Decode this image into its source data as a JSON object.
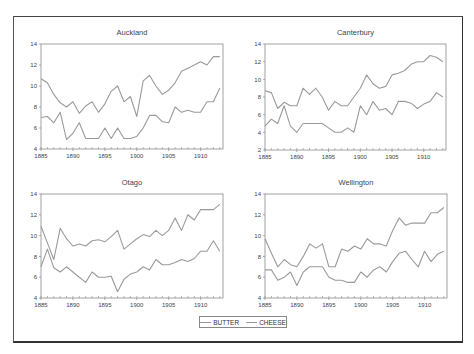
{
  "figure": {
    "legend": [
      {
        "name": "BUTTER",
        "color": "#9a9a9a"
      },
      {
        "name": "CHEESE",
        "color": "#9a9a9a"
      }
    ]
  },
  "chart_data": [
    {
      "type": "line",
      "title": "Auckland",
      "xlabel": "",
      "ylabel": "",
      "x": [
        1885,
        1886,
        1887,
        1888,
        1889,
        1890,
        1891,
        1892,
        1893,
        1894,
        1895,
        1896,
        1897,
        1898,
        1899,
        1900,
        1901,
        1902,
        1903,
        1904,
        1905,
        1906,
        1907,
        1908,
        1909,
        1910,
        1911,
        1912,
        1913
      ],
      "xticks": [
        1885,
        1890,
        1895,
        1900,
        1905,
        1910
      ],
      "yticks": [
        4,
        6,
        8,
        10,
        12,
        14
      ],
      "ylim": [
        4,
        14
      ],
      "grid": false,
      "series": [
        {
          "name": "BUTTER",
          "values": [
            10.7,
            10.3,
            9.2,
            8.4,
            8.0,
            8.5,
            7.4,
            8.1,
            8.5,
            7.5,
            8.3,
            9.5,
            10.0,
            8.5,
            9.0,
            7.1,
            10.5,
            11.0,
            10.0,
            9.2,
            9.6,
            10.3,
            11.4,
            11.7,
            12.0,
            12.3,
            12.0,
            12.8,
            12.8
          ]
        },
        {
          "name": "CHEESE",
          "values": [
            7.0,
            7.1,
            6.5,
            7.5,
            4.9,
            5.5,
            6.5,
            5.0,
            5.0,
            5.0,
            6.0,
            5.0,
            6.0,
            5.0,
            5.0,
            5.2,
            6.0,
            7.2,
            7.2,
            6.6,
            6.5,
            8.0,
            7.5,
            7.7,
            7.5,
            7.5,
            8.5,
            8.5,
            9.8
          ]
        }
      ]
    },
    {
      "type": "line",
      "title": "Canterbury",
      "xlabel": "",
      "ylabel": "",
      "x": [
        1885,
        1886,
        1887,
        1888,
        1889,
        1890,
        1891,
        1892,
        1893,
        1894,
        1895,
        1896,
        1897,
        1898,
        1899,
        1900,
        1901,
        1902,
        1903,
        1904,
        1905,
        1906,
        1907,
        1908,
        1909,
        1910,
        1911,
        1912,
        1913
      ],
      "xticks": [
        1885,
        1890,
        1895,
        1900,
        1905,
        1910
      ],
      "yticks": [
        2,
        4,
        6,
        8,
        10,
        12,
        14
      ],
      "ylim": [
        2,
        14
      ],
      "grid": false,
      "series": [
        {
          "name": "BUTTER",
          "values": [
            8.7,
            8.5,
            6.7,
            7.4,
            7.0,
            7.0,
            9.0,
            8.3,
            9.0,
            8.0,
            6.5,
            7.5,
            7.0,
            7.0,
            8.0,
            9.0,
            10.5,
            9.5,
            9.0,
            9.2,
            10.5,
            10.7,
            11.0,
            11.7,
            12.0,
            12.0,
            12.7,
            12.5,
            12.0
          ]
        },
        {
          "name": "CHEESE",
          "values": [
            4.7,
            5.5,
            5.0,
            7.0,
            4.7,
            4.0,
            5.0,
            5.0,
            5.0,
            5.0,
            4.5,
            4.0,
            4.0,
            4.5,
            4.0,
            7.0,
            6.0,
            7.5,
            6.5,
            6.7,
            6.0,
            7.5,
            7.5,
            7.3,
            6.7,
            7.2,
            7.5,
            8.5,
            8.0
          ]
        }
      ]
    },
    {
      "type": "line",
      "title": "Otago",
      "xlabel": "",
      "ylabel": "",
      "x": [
        1885,
        1886,
        1887,
        1888,
        1889,
        1890,
        1891,
        1892,
        1893,
        1894,
        1895,
        1896,
        1897,
        1898,
        1899,
        1900,
        1901,
        1902,
        1903,
        1904,
        1905,
        1906,
        1907,
        1908,
        1909,
        1910,
        1911,
        1912,
        1913
      ],
      "xticks": [
        1885,
        1890,
        1895,
        1900,
        1905,
        1910
      ],
      "yticks": [
        4,
        6,
        8,
        10,
        12,
        14
      ],
      "ylim": [
        4,
        14
      ],
      "grid": false,
      "series": [
        {
          "name": "BUTTER",
          "values": [
            10.9,
            9.3,
            7.7,
            10.7,
            9.7,
            9.0,
            9.2,
            9.0,
            9.5,
            9.6,
            9.4,
            9.9,
            10.5,
            8.7,
            9.2,
            9.7,
            10.1,
            9.9,
            10.5,
            10.0,
            10.5,
            11.7,
            10.5,
            12.0,
            11.5,
            12.5,
            12.5,
            12.5,
            13.0
          ]
        },
        {
          "name": "CHEESE",
          "values": [
            7.0,
            8.7,
            6.9,
            6.5,
            7.0,
            6.5,
            6.0,
            5.5,
            6.5,
            6.0,
            6.0,
            6.1,
            4.6,
            5.8,
            6.3,
            6.5,
            7.0,
            6.7,
            7.7,
            7.2,
            7.2,
            7.4,
            7.7,
            7.5,
            7.8,
            8.5,
            8.5,
            9.5,
            8.5
          ]
        }
      ]
    },
    {
      "type": "line",
      "title": "Wellington",
      "xlabel": "",
      "ylabel": "",
      "x": [
        1885,
        1886,
        1887,
        1888,
        1889,
        1890,
        1891,
        1892,
        1893,
        1894,
        1895,
        1896,
        1897,
        1898,
        1899,
        1900,
        1901,
        1902,
        1903,
        1904,
        1905,
        1906,
        1907,
        1908,
        1909,
        1910,
        1911,
        1912,
        1913
      ],
      "xticks": [
        1885,
        1890,
        1895,
        1900,
        1905,
        1910
      ],
      "yticks": [
        4,
        6,
        8,
        10,
        12,
        14
      ],
      "ylim": [
        4,
        14
      ],
      "grid": false,
      "series": [
        {
          "name": "BUTTER",
          "values": [
            9.7,
            8.3,
            7.0,
            7.7,
            7.2,
            7.0,
            8.0,
            9.2,
            8.8,
            9.2,
            7.0,
            7.0,
            8.7,
            8.5,
            9.0,
            8.7,
            9.7,
            9.2,
            9.2,
            9.0,
            10.5,
            11.7,
            11.0,
            11.2,
            11.2,
            11.2,
            12.2,
            12.2,
            12.7
          ]
        },
        {
          "name": "CHEESE",
          "values": [
            6.7,
            6.7,
            5.7,
            6.0,
            6.5,
            5.2,
            6.5,
            7.0,
            7.0,
            7.0,
            6.0,
            5.7,
            5.7,
            5.5,
            5.5,
            6.5,
            6.0,
            6.7,
            7.0,
            6.5,
            7.5,
            8.3,
            8.5,
            7.7,
            7.0,
            8.5,
            7.5,
            8.2,
            8.5
          ]
        }
      ]
    }
  ],
  "panels_layout": [
    {
      "left": 41,
      "top": 44,
      "width": 182,
      "height": 105
    },
    {
      "left": 265,
      "top": 44,
      "width": 181,
      "height": 106
    },
    {
      "left": 41,
      "top": 194,
      "width": 182,
      "height": 104
    },
    {
      "left": 265,
      "top": 194,
      "width": 182,
      "height": 104
    }
  ],
  "style": {
    "line_color": "#9a9a9a",
    "axis_color": "#8a8a8a",
    "text_color": "#444444"
  }
}
